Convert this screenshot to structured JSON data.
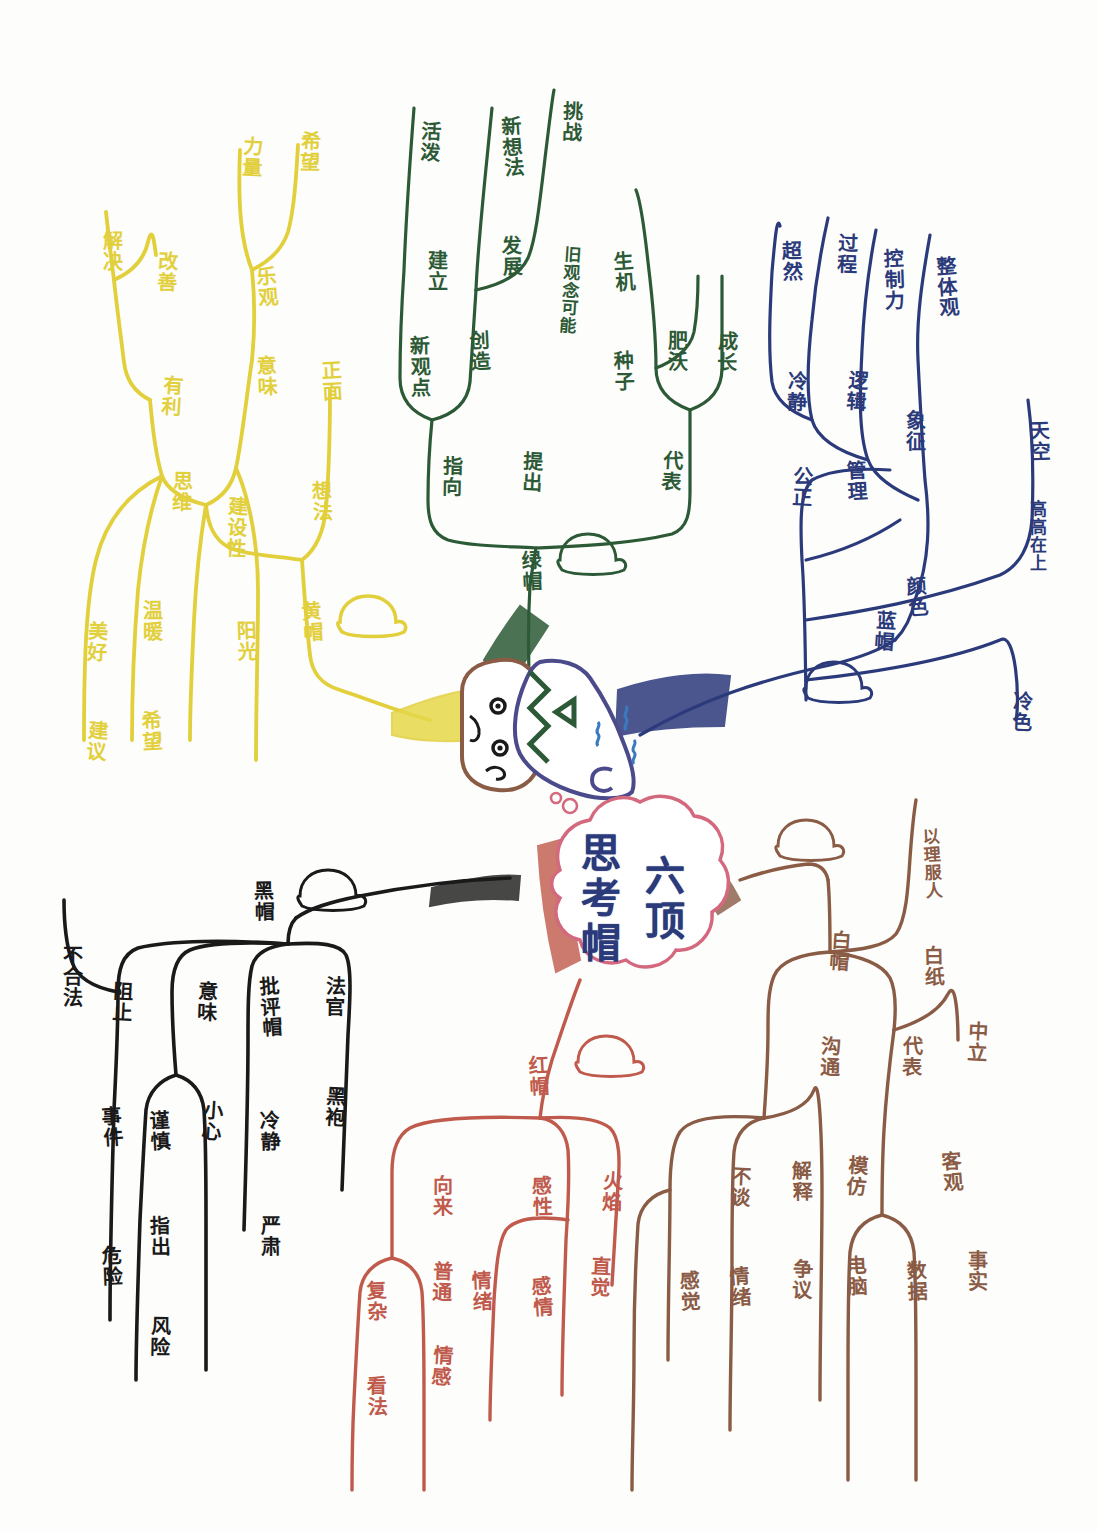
{
  "center": {
    "text": "六顶思考帽",
    "col_right": "六顶",
    "col_left": "思考帽",
    "bubble_color": "#d4687e",
    "text_color": "#2b3a7a"
  },
  "branches": [
    {
      "id": "blue-hat",
      "name": "蓝帽",
      "color": "#2b3a7a",
      "icon": "hat-icon",
      "nodes": [
        {
          "label": "整体观",
          "x": 935,
          "y": 255
        },
        {
          "label": "控制力",
          "x": 882,
          "y": 248
        },
        {
          "label": "象征",
          "x": 903,
          "y": 410
        },
        {
          "label": "过程",
          "x": 835,
          "y": 232
        },
        {
          "label": "逻辑",
          "x": 845,
          "y": 370
        },
        {
          "label": "管理",
          "x": 845,
          "y": 460
        },
        {
          "label": "超然",
          "x": 780,
          "y": 240
        },
        {
          "label": "冷静",
          "x": 785,
          "y": 370
        },
        {
          "label": "公正",
          "x": 790,
          "y": 465
        },
        {
          "label": "颜色",
          "x": 905,
          "y": 575
        },
        {
          "label": "天空",
          "x": 1028,
          "y": 420
        },
        {
          "label": "高高在上",
          "x": 1028,
          "y": 500
        },
        {
          "label": "冷色",
          "x": 1010,
          "y": 690
        },
        {
          "label": "蓝帽",
          "x": 873,
          "y": 610
        }
      ]
    },
    {
      "id": "green-hat",
      "name": "绿帽",
      "color": "#2d5a36",
      "icon": "hat-icon",
      "nodes": [
        {
          "label": "活泼",
          "x": 418,
          "y": 120
        },
        {
          "label": "新想法",
          "x": 500,
          "y": 115
        },
        {
          "label": "发展",
          "x": 500,
          "y": 235
        },
        {
          "label": "建立",
          "x": 425,
          "y": 250
        },
        {
          "label": "挑战",
          "x": 560,
          "y": 100
        },
        {
          "label": "旧观念可能",
          "x": 560,
          "y": 245
        },
        {
          "label": "创造",
          "x": 468,
          "y": 330
        },
        {
          "label": "新观点",
          "x": 408,
          "y": 335
        },
        {
          "label": "指向",
          "x": 440,
          "y": 455
        },
        {
          "label": "提出",
          "x": 520,
          "y": 450
        },
        {
          "label": "生机",
          "x": 612,
          "y": 250
        },
        {
          "label": "种子",
          "x": 612,
          "y": 350
        },
        {
          "label": "肥沃",
          "x": 665,
          "y": 330
        },
        {
          "label": "成长",
          "x": 715,
          "y": 330
        },
        {
          "label": "代表",
          "x": 660,
          "y": 450
        },
        {
          "label": "绿帽",
          "x": 520,
          "y": 550
        }
      ]
    },
    {
      "id": "yellow-hat",
      "name": "黄帽",
      "color": "#e2cf3c",
      "icon": "hat-icon",
      "nodes": [
        {
          "label": "希望",
          "x": 298,
          "y": 130
        },
        {
          "label": "力量",
          "x": 240,
          "y": 135
        },
        {
          "label": "乐观",
          "x": 255,
          "y": 265
        },
        {
          "label": "意味",
          "x": 255,
          "y": 355
        },
        {
          "label": "解决",
          "x": 100,
          "y": 230
        },
        {
          "label": "改善",
          "x": 155,
          "y": 250
        },
        {
          "label": "有利",
          "x": 160,
          "y": 375
        },
        {
          "label": "正面",
          "x": 320,
          "y": 360
        },
        {
          "label": "想法",
          "x": 310,
          "y": 480
        },
        {
          "label": "思维",
          "x": 170,
          "y": 470
        },
        {
          "label": "建设性",
          "x": 225,
          "y": 495
        },
        {
          "label": "黄帽",
          "x": 300,
          "y": 600
        },
        {
          "label": "阳光",
          "x": 235,
          "y": 620
        },
        {
          "label": "温暖",
          "x": 140,
          "y": 600
        },
        {
          "label": "美好",
          "x": 85,
          "y": 620
        },
        {
          "label": "建议",
          "x": 85,
          "y": 720
        },
        {
          "label": "希望",
          "x": 140,
          "y": 710
        }
      ]
    },
    {
      "id": "black-hat",
      "name": "黑帽",
      "color": "#1a1a1a",
      "icon": "hat-icon",
      "nodes": [
        {
          "label": "黑帽",
          "x": 252,
          "y": 880
        },
        {
          "label": "法官",
          "x": 323,
          "y": 975
        },
        {
          "label": "黑袍",
          "x": 323,
          "y": 1085
        },
        {
          "label": "批评帽",
          "x": 258,
          "y": 975
        },
        {
          "label": "冷静",
          "x": 258,
          "y": 1110
        },
        {
          "label": "严肃",
          "x": 258,
          "y": 1215
        },
        {
          "label": "意味",
          "x": 195,
          "y": 980
        },
        {
          "label": "小心",
          "x": 200,
          "y": 1100
        },
        {
          "label": "谨慎",
          "x": 148,
          "y": 1110
        },
        {
          "label": "指出",
          "x": 148,
          "y": 1215
        },
        {
          "label": "风险",
          "x": 148,
          "y": 1315
        },
        {
          "label": "阻止",
          "x": 110,
          "y": 980
        },
        {
          "label": "事件",
          "x": 100,
          "y": 1105
        },
        {
          "label": "危险",
          "x": 100,
          "y": 1245
        },
        {
          "label": "不合法",
          "x": 60,
          "y": 945
        }
      ]
    },
    {
      "id": "red-hat",
      "name": "红帽",
      "color": "#c05a4c",
      "icon": "hat-icon",
      "nodes": [
        {
          "label": "红帽",
          "x": 527,
          "y": 1055
        },
        {
          "label": "感性",
          "x": 530,
          "y": 1175
        },
        {
          "label": "火焰",
          "x": 600,
          "y": 1170
        },
        {
          "label": "直觉",
          "x": 588,
          "y": 1255
        },
        {
          "label": "感情",
          "x": 530,
          "y": 1275
        },
        {
          "label": "情绪",
          "x": 470,
          "y": 1270
        },
        {
          "label": "向来",
          "x": 430,
          "y": 1175
        },
        {
          "label": "普通",
          "x": 430,
          "y": 1260
        },
        {
          "label": "情感",
          "x": 430,
          "y": 1345
        },
        {
          "label": "复杂",
          "x": 365,
          "y": 1280
        },
        {
          "label": "看法",
          "x": 365,
          "y": 1375
        }
      ]
    },
    {
      "id": "white-hat",
      "name": "白帽",
      "color": "#8a5b45",
      "icon": "hat-icon",
      "nodes": [
        {
          "label": "白帽",
          "x": 828,
          "y": 930
        },
        {
          "label": "以理服人",
          "x": 922,
          "y": 828
        },
        {
          "label": "白纸",
          "x": 922,
          "y": 945
        },
        {
          "label": "代表",
          "x": 900,
          "y": 1035
        },
        {
          "label": "中立",
          "x": 965,
          "y": 1020
        },
        {
          "label": "客观",
          "x": 940,
          "y": 1150
        },
        {
          "label": "数据",
          "x": 905,
          "y": 1260
        },
        {
          "label": "事实",
          "x": 965,
          "y": 1250
        },
        {
          "label": "沟通",
          "x": 818,
          "y": 1035
        },
        {
          "label": "模仿",
          "x": 845,
          "y": 1155
        },
        {
          "label": "电脑",
          "x": 845,
          "y": 1255
        },
        {
          "label": "解释",
          "x": 790,
          "y": 1160
        },
        {
          "label": "争议",
          "x": 790,
          "y": 1258
        },
        {
          "label": "不谈",
          "x": 728,
          "y": 1165
        },
        {
          "label": "情绪",
          "x": 728,
          "y": 1265
        },
        {
          "label": "感觉",
          "x": 678,
          "y": 1270
        }
      ]
    }
  ],
  "figure": {
    "name": "cartoon-face-with-hat",
    "face_color": "#8a5b45",
    "hat_color": "#4b4a8a"
  }
}
